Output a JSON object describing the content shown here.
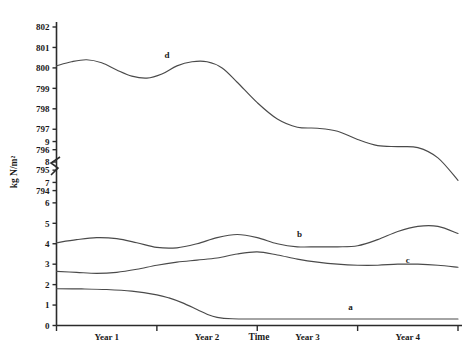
{
  "chart_data": {
    "type": "line",
    "title": "",
    "xlabel": "Time",
    "ylabel": "kg N/m²",
    "grid": false,
    "legend": "inline-labels",
    "axis_break": {
      "present": true,
      "between": [
        9,
        794
      ],
      "note": "zigzag break on y-axis between 9 and 794"
    },
    "x_tick_labels": [
      "Year 1",
      "Year 2",
      "Year 3",
      "Year 4"
    ],
    "x_tick_positions": [
      0.5,
      1.5,
      2.5,
      3.5
    ],
    "x_minor_ticks": [
      0,
      1,
      2,
      3,
      4
    ],
    "xlim": [
      0,
      4
    ],
    "y_upper_ticks": [
      794,
      795,
      796,
      797,
      798,
      799,
      800,
      801,
      802
    ],
    "y_lower_ticks": [
      0,
      1,
      2,
      3,
      4,
      5,
      6,
      7,
      8,
      9
    ],
    "ylim_upper": [
      794,
      802
    ],
    "ylim_lower": [
      0,
      9
    ],
    "series": [
      {
        "name": "a",
        "label": "a",
        "label_x": 2.93,
        "label_y": 0.75,
        "scale": "lower",
        "x": [
          0.0,
          0.25,
          0.5,
          0.75,
          1.0,
          1.12,
          1.25,
          1.4,
          1.5,
          1.6,
          1.75,
          2.0,
          2.5,
          3.0,
          3.5,
          4.0
        ],
        "values": [
          1.8,
          1.79,
          1.76,
          1.68,
          1.5,
          1.35,
          1.12,
          0.78,
          0.55,
          0.4,
          0.33,
          0.32,
          0.32,
          0.32,
          0.32,
          0.32
        ]
      },
      {
        "name": "b",
        "label": "b",
        "label_x": 2.42,
        "label_y": 4.35,
        "scale": "lower",
        "x": [
          0.0,
          0.2,
          0.4,
          0.6,
          0.8,
          1.0,
          1.2,
          1.4,
          1.6,
          1.8,
          2.0,
          2.2,
          2.4,
          2.6,
          2.8,
          3.0,
          3.2,
          3.4,
          3.6,
          3.8,
          4.0
        ],
        "values": [
          4.05,
          4.2,
          4.3,
          4.25,
          4.05,
          3.82,
          3.8,
          4.0,
          4.3,
          4.45,
          4.3,
          4.0,
          3.85,
          3.85,
          3.85,
          3.9,
          4.2,
          4.6,
          4.85,
          4.85,
          4.5
        ]
      },
      {
        "name": "c",
        "label": "c",
        "label_x": 3.5,
        "label_y": 3.05,
        "scale": "lower",
        "x": [
          0.0,
          0.2,
          0.4,
          0.6,
          0.8,
          1.0,
          1.2,
          1.4,
          1.6,
          1.8,
          2.0,
          2.2,
          2.4,
          2.6,
          2.8,
          3.0,
          3.2,
          3.4,
          3.6,
          3.8,
          4.0
        ],
        "values": [
          2.65,
          2.6,
          2.55,
          2.6,
          2.75,
          2.95,
          3.1,
          3.2,
          3.3,
          3.5,
          3.6,
          3.45,
          3.25,
          3.1,
          3.0,
          2.95,
          2.95,
          3.0,
          3.0,
          2.95,
          2.85
        ]
      },
      {
        "name": "d",
        "label": "d",
        "label_x": 1.1,
        "label_y": 800.5,
        "scale": "upper",
        "x": [
          0.0,
          0.15,
          0.3,
          0.45,
          0.6,
          0.75,
          0.9,
          1.05,
          1.2,
          1.35,
          1.5,
          1.65,
          1.8,
          2.0,
          2.2,
          2.4,
          2.6,
          2.8,
          3.0,
          3.2,
          3.4,
          3.6,
          3.8,
          4.0
        ],
        "values": [
          800.1,
          800.3,
          800.4,
          800.25,
          799.9,
          799.6,
          799.5,
          799.7,
          800.1,
          800.3,
          800.3,
          800.0,
          799.3,
          798.3,
          797.5,
          797.1,
          797.05,
          796.9,
          796.5,
          796.2,
          796.15,
          796.1,
          795.6,
          794.5
        ]
      }
    ]
  }
}
